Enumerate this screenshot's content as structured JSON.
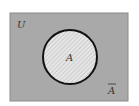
{
  "diagram": {
    "type": "venn",
    "universe_label": "U",
    "set_label": "A",
    "complement_label": "A",
    "complement_overbar": true,
    "colors": {
      "universe_fill": "#a9a9a9",
      "universe_border": "#8a8a8a",
      "circle_fill": "#e6e6e6",
      "circle_hatch": "#bdbdbd",
      "circle_stroke": "#111111",
      "text": "#333333"
    }
  }
}
